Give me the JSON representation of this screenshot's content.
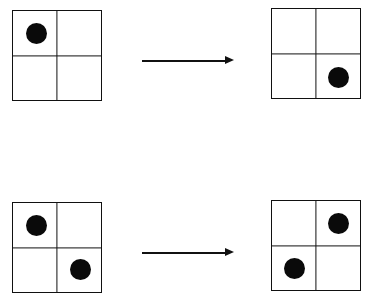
{
  "diagram": {
    "type": "grid-transformation",
    "rows": [
      {
        "before": {
          "grid": "2x2",
          "filled_cells": [
            "top-left"
          ]
        },
        "arrow": "right",
        "after": {
          "grid": "2x2",
          "filled_cells": [
            "bottom-right"
          ]
        }
      },
      {
        "before": {
          "grid": "2x2",
          "filled_cells": [
            "top-left",
            "bottom-right"
          ]
        },
        "arrow": "right",
        "after": {
          "grid": "2x2",
          "filled_cells": [
            "top-right",
            "bottom-left"
          ]
        }
      }
    ],
    "colors": {
      "line": "#111111",
      "dot": "#0a0a0a",
      "background": "#ffffff"
    }
  }
}
